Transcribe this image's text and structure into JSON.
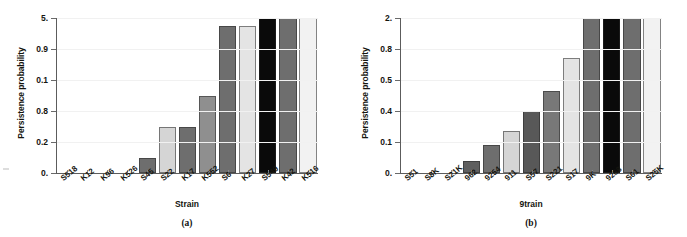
{
  "figure": {
    "background": "#ffffff",
    "panels": [
      "a",
      "b"
    ]
  },
  "panel_a": {
    "caption": "(a)",
    "ylabel": "Persistence probability",
    "xlabel": "Strain",
    "ytick_labels": [
      "5.",
      "0.9",
      "0.1",
      "0.8",
      "0.2",
      "0."
    ],
    "xtick_labels": [
      "S518",
      "K12",
      "K96",
      "K526",
      "S45",
      "S22",
      "K17",
      "K552",
      "S6",
      "K27",
      "S549",
      "K42",
      "K516"
    ]
  },
  "panel_b": {
    "caption": "(b)",
    "ylabel": "Persistence probability",
    "xlabel": "9train",
    "ytick_labels": [
      "2.",
      "0.8",
      "0.5",
      "0.4",
      "0.1",
      "0."
    ],
    "xtick_labels": [
      "S51",
      "S8K",
      "S21K",
      "962",
      "9254",
      "911",
      "S57",
      "S221",
      "S17",
      "9K",
      "9268",
      "S61",
      "S25K"
    ]
  },
  "chart_data": [
    {
      "type": "bar",
      "panel": "a",
      "title": "",
      "xlabel": "Strain",
      "ylabel": "Persistence probability",
      "categories": [
        "S518",
        "K12",
        "K96",
        "K526",
        "S45",
        "S22",
        "K17",
        "K552",
        "S6",
        "K27",
        "S549",
        "K42",
        "K516"
      ],
      "values": [
        0.0,
        0.0,
        0.0,
        0.0,
        0.1,
        0.3,
        0.3,
        0.5,
        0.95,
        0.95,
        1.0,
        1.0,
        1.0
      ],
      "tick_values": [
        1.0,
        0.8,
        0.6,
        0.4,
        0.2,
        0.0
      ],
      "tick_labels_as_printed": [
        "5.",
        "0.9",
        "0.1",
        "0.8",
        "0.2",
        "0."
      ],
      "ylim": [
        0,
        1
      ],
      "grid": true,
      "legend": "none",
      "bar_colors": [
        "#ffffff",
        "#ffffff",
        "#ffffff",
        "#ffffff",
        "#6e6e6e",
        "#d5d5d5",
        "#6e6e6e",
        "#8f8f8f",
        "#6e6e6e",
        "#e4e4e4",
        "#0a0a0a",
        "#6e6e6e",
        "#f2f2f2"
      ]
    },
    {
      "type": "bar",
      "panel": "b",
      "title": "",
      "xlabel": "9train",
      "ylabel": "Persistence probability",
      "categories": [
        "S51",
        "S8K",
        "S21K",
        "962",
        "9254",
        "911",
        "S57",
        "S221",
        "S17",
        "9K",
        "9268",
        "S61",
        "S25K"
      ],
      "values": [
        0.0,
        0.0,
        0.0,
        0.08,
        0.18,
        0.27,
        0.4,
        0.53,
        0.74,
        1.0,
        1.0,
        1.0,
        1.0
      ],
      "tick_values": [
        1.0,
        0.8,
        0.6,
        0.4,
        0.2,
        0.0
      ],
      "tick_labels_as_printed": [
        "2.",
        "0.8",
        "0.5",
        "0.4",
        "0.1",
        "0."
      ],
      "ylim": [
        0,
        1
      ],
      "grid": true,
      "legend": "none",
      "bar_colors": [
        "#ffffff",
        "#ffffff",
        "#ffffff",
        "#5f5f5f",
        "#6e6e6e",
        "#d5d5d5",
        "#585858",
        "#787878",
        "#e4e4e4",
        "#6e6e6e",
        "#0a0a0a",
        "#6e6e6e",
        "#f2f2f2"
      ]
    }
  ]
}
